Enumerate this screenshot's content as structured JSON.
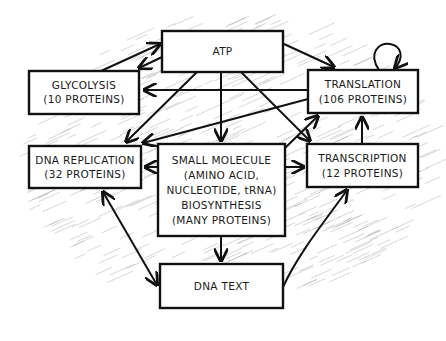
{
  "diagram": {
    "type": "sketched-flow-diagram",
    "nodes": [
      {
        "id": "atp",
        "lines": [
          "ATP"
        ]
      },
      {
        "id": "glycolysis",
        "lines": [
          "GLYCOLYSIS",
          "(10 PROTEINS)"
        ]
      },
      {
        "id": "translation",
        "lines": [
          "TRANSLATION",
          "(106 PROTEINS)"
        ]
      },
      {
        "id": "dna_replication",
        "lines": [
          "DNA REPLICATION",
          "(32 PROTEINS)"
        ]
      },
      {
        "id": "small_molecule",
        "lines": [
          "SMALL MOLECULE",
          "(AMINO ACID,",
          "NUCLEOTIDE, tRNA)",
          "BIOSYNTHESIS",
          "(MANY PROTEINS)"
        ]
      },
      {
        "id": "transcription",
        "lines": [
          "TRANSCRIPTION",
          "(12 PROTEINS)"
        ]
      },
      {
        "id": "dna_text",
        "lines": [
          "DNA TEXT"
        ]
      }
    ],
    "edges": [
      {
        "from": "glycolysis",
        "to": "atp",
        "arrow": "end"
      },
      {
        "from": "atp",
        "to": "glycolysis",
        "arrow": "end"
      },
      {
        "from": "atp",
        "to": "translation",
        "arrow": "end"
      },
      {
        "from": "translation",
        "to": "translation",
        "arrow": "end",
        "kind": "self-loop"
      },
      {
        "from": "translation",
        "to": "glycolysis",
        "arrow": "end"
      },
      {
        "from": "atp",
        "to": "dna_replication",
        "arrow": "end"
      },
      {
        "from": "translation",
        "to": "dna_replication",
        "arrow": "end"
      },
      {
        "from": "atp",
        "to": "small_molecule",
        "arrow": "end"
      },
      {
        "from": "atp",
        "to": "transcription",
        "arrow": "end"
      },
      {
        "from": "small_molecule",
        "to": "translation",
        "arrow": "end"
      },
      {
        "from": "small_molecule",
        "to": "dna_replication",
        "arrow": "end"
      },
      {
        "from": "small_molecule",
        "to": "transcription",
        "arrow": "end"
      },
      {
        "from": "transcription",
        "to": "translation",
        "arrow": "end"
      },
      {
        "from": "small_molecule",
        "to": "dna_text",
        "arrow": "end"
      },
      {
        "from": "dna_replication",
        "to": "dna_text",
        "arrow": "both"
      },
      {
        "from": "dna_text",
        "to": "transcription",
        "arrow": "end"
      }
    ]
  },
  "colors": {
    "ink": "#111111",
    "box_fill": "#ffffff",
    "hatch": "#9a9a9a",
    "background": "#ffffff"
  }
}
